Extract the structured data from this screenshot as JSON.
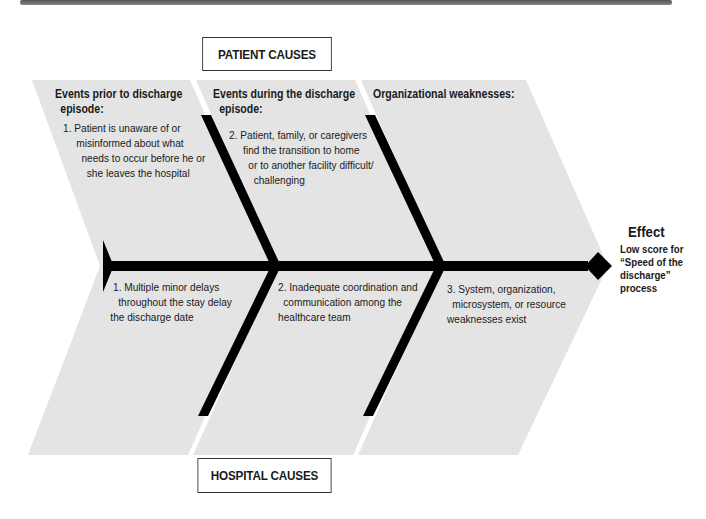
{
  "diagram": {
    "type": "fishbone",
    "top_label": "PATIENT CAUSES",
    "bottom_label": "HOSPITAL CAUSES",
    "effect": {
      "title": "Effect",
      "description_lines": [
        "Low score for",
        "“Speed of the",
        "discharge”",
        "process"
      ]
    },
    "categories": [
      {
        "heading_lines": [
          "Events prior to discharge",
          "episode:"
        ],
        "patient_cause_lines": [
          "1. Patient is unaware of or",
          "misinformed about what",
          "needs to occur before he or",
          "she leaves the hospital"
        ],
        "hospital_cause_lines": [
          "1. Multiple minor delays",
          "throughout the stay delay",
          "the discharge date"
        ]
      },
      {
        "heading_lines": [
          "Events during the discharge",
          "episode:"
        ],
        "patient_cause_lines": [
          "2. Patient, family, or caregivers",
          "find the transition to home",
          "or to another facility difficult/",
          "challenging"
        ],
        "hospital_cause_lines": [
          "2. Inadequate coordination and",
          "communication among the",
          "healthcare team"
        ]
      },
      {
        "heading_lines": [
          "Organizational weaknesses:"
        ],
        "patient_cause_lines": [],
        "hospital_cause_lines": [
          "3. System, organization,",
          "microsystem, or resource",
          "weaknesses exist"
        ]
      }
    ],
    "colors": {
      "panel": "#e4e4e4",
      "bone": "#000000",
      "text": "#1a1a1a"
    }
  }
}
